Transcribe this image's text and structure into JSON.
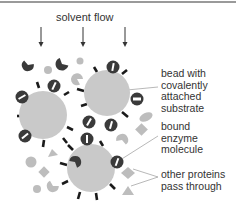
{
  "diagram": {
    "title": "solvent flow",
    "labels": {
      "bead": "bead with\ncovalently\nattached\nsubstrate",
      "enzyme": "bound\nenzyme\nmolecule",
      "other": "other proteins\npass through"
    },
    "colors": {
      "bead": "#c9c9c9",
      "enzyme": "#3a3a3a",
      "other_proteins": "#bdbdbd",
      "arrows": "#333333",
      "spokes": "#1a1a1a",
      "top_rule": "#9a9a9a"
    },
    "counts": {
      "beads": 3,
      "flow_arrows": 3
    }
  }
}
